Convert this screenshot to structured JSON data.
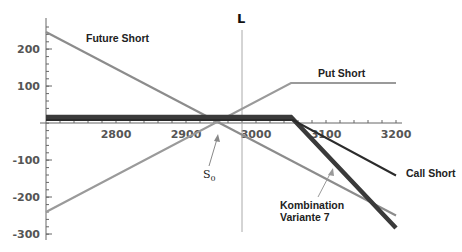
{
  "chart_data": {
    "type": "line",
    "title": "",
    "xlabel": "",
    "ylabel": "",
    "xlim": [
      2700,
      3210
    ],
    "ylim": [
      -310,
      270
    ],
    "grid": false,
    "x_ticks": [
      2800,
      2900,
      3000,
      3100,
      3200
    ],
    "y_ticks": [
      200,
      100,
      -100,
      -200,
      -300
    ],
    "x_tick_labels": [
      "2800",
      "2900",
      "3000",
      "3100",
      "3200"
    ],
    "y_tick_labels": [
      "200",
      "100",
      "-100",
      "-200",
      "-300"
    ],
    "vertical_marker": {
      "label": "L",
      "x": 2980
    },
    "series": [
      {
        "name": "Future Short",
        "color": "#8c8c8c",
        "width": 2.2,
        "points": [
          [
            2700,
            245
          ],
          [
            3200,
            -250
          ]
        ]
      },
      {
        "name": "Put Short",
        "color": "#9a9a9a",
        "width": 2.2,
        "points": [
          [
            2700,
            -240
          ],
          [
            3050,
            108
          ],
          [
            3200,
            108
          ]
        ]
      },
      {
        "name": "Call Short",
        "color": "#2b2b2b",
        "width": 2.2,
        "points": [
          [
            2700,
            20
          ],
          [
            3050,
            20
          ],
          [
            3200,
            -142
          ]
        ]
      },
      {
        "name": "Kombination Variante 7",
        "color": "#3a3a3a",
        "width": 4.5,
        "points": [
          [
            2700,
            20
          ],
          [
            3050,
            20
          ],
          [
            3200,
            -285
          ]
        ]
      }
    ],
    "annotations": [
      {
        "text": "Future Short",
        "x": 2843,
        "y": 220
      },
      {
        "text": "Put Short",
        "x": 3060,
        "y": 125
      },
      {
        "text": "Call Short",
        "x": 3223,
        "y": -132
      },
      {
        "text": "Kombination",
        "x": 3083,
        "y": -222
      },
      {
        "text": "Variante 7",
        "x": 3083,
        "y": -254
      },
      {
        "text": "S0",
        "x": 2923,
        "y": -145,
        "arrow_to": [
          2947,
          -27
        ]
      },
      {
        "text": "L",
        "x": 2977,
        "y": 285
      }
    ]
  },
  "labels": {
    "future_short": "Future Short",
    "put_short": "Put Short",
    "call_short": "Call Short",
    "kombination_line1": "Kombination",
    "kombination_line2": "Variante 7",
    "s0_main": "S",
    "s0_sub": "0",
    "l_marker": "L"
  },
  "axis": {
    "x": [
      "2800",
      "2900",
      "3000",
      "3100",
      "3200"
    ],
    "y": [
      "200",
      "100",
      "-100",
      "-200",
      "-300"
    ]
  }
}
